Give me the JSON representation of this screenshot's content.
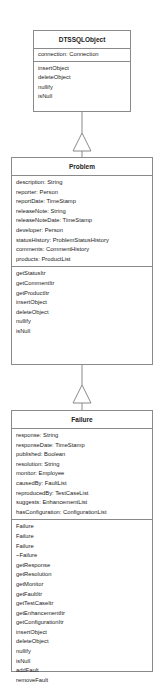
{
  "diagram": {
    "type": "uml-class-inheritance",
    "colors": {
      "border": "#8a8a8a",
      "text": "#222222",
      "background": "#ffffff"
    },
    "classes": [
      {
        "name": "DTSSQLObject",
        "attributes": [
          "connection:  Connection"
        ],
        "operations": [
          "insertObject",
          "deleteObject",
          "nullify",
          "isNull"
        ]
      },
      {
        "name": "Problem",
        "attributes": [
          "description: String",
          "reporter:  Person",
          "reportDate:  TimeStamp",
          "releaseNote: String",
          "releaseNoteDate: TimeStamp",
          "developer:  Person",
          "statusHistory:  ProblemStatusHistory",
          "comments:  CommentHistory",
          "products:  ProductList"
        ],
        "operations": [
          "getStatusItr",
          "getCommentItr",
          "getProductItr",
          "insertObject",
          "deleteObject",
          "nullify",
          "isNull"
        ]
      },
      {
        "name": "Failure",
        "attributes": [
          "response:  String",
          "responseDate: TimeStamp",
          "published:  Boolean",
          "resolution:  String",
          "monitor:  Employee",
          "causedBy:  FaultList",
          "reproducedBy:  TestCaseList",
          "suggests:  EnhancementList",
          "hasConfiguration:  ConfigurationList"
        ],
        "operations": [
          "Failure",
          "Failure",
          "Failure",
          "~Failure",
          "getResponse",
          "getResolution",
          "getMonitor",
          "getFaultItr",
          "getTestCaseItr",
          "getEnhancementItr",
          "getConfigurationItr",
          "insertObject",
          "deleteObject",
          "nullify",
          "isNull",
          "addFault",
          "removeFault"
        ]
      }
    ],
    "relations": [
      {
        "from": "Problem",
        "to": "DTSSQLObject",
        "kind": "generalization"
      },
      {
        "from": "Failure",
        "to": "Problem",
        "kind": "generalization"
      }
    ]
  }
}
